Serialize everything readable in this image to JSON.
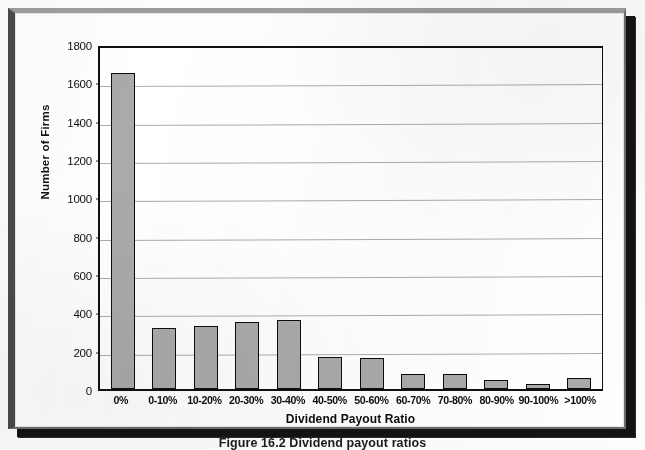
{
  "figure": {
    "caption": "Figure 16.2    Dividend payout ratios",
    "y_axis_title": "Number of Firms",
    "x_axis_title": "Dividend Payout Ratio"
  },
  "chart_data": {
    "type": "bar",
    "title": "",
    "subtitle": "",
    "xlabel": "Dividend Payout Ratio",
    "ylabel": "Number of Firms",
    "categories": [
      "0%",
      "0-10%",
      "10-20%",
      "20-30%",
      "30-40%",
      "40-50%",
      "50-60%",
      "60-70%",
      "70-80%",
      "80-90%",
      "90-100%",
      ">100%"
    ],
    "values": [
      1650,
      320,
      330,
      350,
      360,
      165,
      163,
      80,
      80,
      48,
      25,
      58
    ],
    "ylim": [
      0,
      1800
    ],
    "yticks": [
      0,
      200,
      400,
      600,
      800,
      1000,
      1200,
      1400,
      1600,
      1800
    ],
    "ytick_labels": [
      "0",
      "200",
      "400",
      "600",
      "800",
      "1000",
      "1200",
      "1400",
      "1600",
      "1800"
    ],
    "grid": true,
    "grid_axis": "y",
    "legend": false,
    "legend_position": "none",
    "bar_fill_color": "#aaaaaa",
    "bar_edge_color": "#0c0c0c",
    "plot_background_color": "#ffffff",
    "gridline_color": "#9a9a9a",
    "axis_color": "#111111"
  }
}
